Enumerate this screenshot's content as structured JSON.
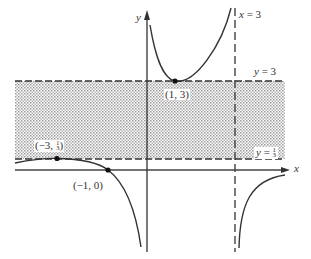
{
  "diagram": {
    "type": "function-graph",
    "axes": {
      "x_label": "x",
      "y_label": "y"
    },
    "asymptotes": {
      "vertical": {
        "label_var": "x",
        "label_eq": "=",
        "label_val": "3"
      },
      "horizontal_upper": {
        "label_var": "y",
        "label_eq": "=",
        "label_val": "3"
      },
      "horizontal_lower": {
        "label_var": "y",
        "label_eq": "=",
        "label_val_num": "1",
        "label_val_den": "3"
      }
    },
    "points": [
      {
        "label": "(1, 3)"
      },
      {
        "label_prefix": "(−3, ",
        "label_num": "1",
        "label_den": "3",
        "label_suffix": ")"
      },
      {
        "label": "(−1, 0)"
      }
    ],
    "shaded_region": "band between y = 1/3 and y = 3",
    "colors": {
      "ink": "#333333",
      "shade_dot": "#9a9a9a",
      "background": "#ffffff"
    }
  }
}
